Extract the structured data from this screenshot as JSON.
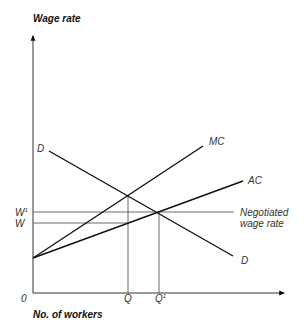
{
  "diagram": {
    "type": "monopsony-labour-market",
    "y_axis_title": "Wage rate",
    "x_axis_title": "No. of workers",
    "origin_label": "0",
    "curves": {
      "demand": {
        "label_start": "D",
        "label_end": "D"
      },
      "marginal_cost": {
        "label": "MC"
      },
      "average_cost": {
        "label": "AC"
      }
    },
    "wage_labels": {
      "w1": "W",
      "w1_sup": "1",
      "w": "W"
    },
    "quantity_labels": {
      "q": "Q",
      "q1": "Q",
      "q1_sup": "1"
    },
    "negotiated": {
      "line1": "Negotiated",
      "line2": "wage rate"
    }
  }
}
